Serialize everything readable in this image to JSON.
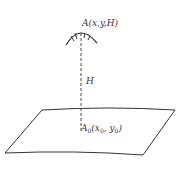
{
  "diagram": {
    "point_top": {
      "label": "A(x,y,H)"
    },
    "height_label": "H",
    "point_ground": {
      "label_main": "A",
      "label_sub": "0",
      "coords_open": "(x",
      "x_sub": "0",
      "sep": ", y",
      "y_sub": "0",
      "close": ")"
    },
    "colors": {
      "stroke": "#333333",
      "background": "#ffffff"
    }
  }
}
